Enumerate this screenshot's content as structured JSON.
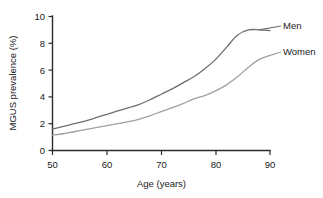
{
  "chart_data": {
    "type": "line",
    "title": "",
    "xlabel": "Age (years)",
    "ylabel": "MGUS prevalence (%)",
    "xlim": [
      50,
      90
    ],
    "ylim": [
      0,
      10
    ],
    "xticks": [
      "50",
      "60",
      "70",
      "80",
      "90"
    ],
    "yticks": [
      "0",
      "2",
      "4",
      "6",
      "8",
      "10"
    ],
    "grid": false,
    "legend_position": "inline-right",
    "x": [
      50,
      52,
      54,
      56,
      58,
      60,
      62,
      64,
      66,
      68,
      70,
      72,
      74,
      76,
      78,
      80,
      82,
      84,
      86,
      88,
      90
    ],
    "series": [
      {
        "name": "Men",
        "color": "#6e6e6e",
        "values": [
          1.6,
          1.8,
          2.0,
          2.2,
          2.45,
          2.7,
          2.95,
          3.2,
          3.45,
          3.8,
          4.2,
          4.6,
          5.05,
          5.5,
          6.1,
          6.8,
          7.7,
          8.6,
          9.0,
          9.0,
          8.95
        ]
      },
      {
        "name": "Women",
        "color": "#a0a0a0",
        "values": [
          1.15,
          1.25,
          1.4,
          1.55,
          1.7,
          1.85,
          2.0,
          2.15,
          2.35,
          2.6,
          2.9,
          3.2,
          3.5,
          3.85,
          4.1,
          4.45,
          4.9,
          5.5,
          6.2,
          6.8,
          7.1
        ]
      }
    ],
    "annotations": [
      {
        "text": "Men",
        "series": "Men"
      },
      {
        "text": "Women",
        "series": "Women"
      }
    ]
  }
}
